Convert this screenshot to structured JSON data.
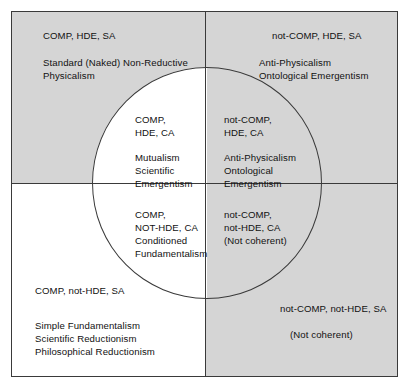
{
  "diagram": {
    "colors": {
      "shaded_fill": "#d5d5d5",
      "plain_fill": "#ffffff",
      "stroke": "#3a3a3a",
      "text": "#111111"
    },
    "outer_quadrants": {
      "top_left": {
        "heading": "COMP, HDE, SA",
        "body": "Standard (Naked) Non-Reductive\nPhysicalism"
      },
      "top_right": {
        "heading": "not-COMP, HDE, SA",
        "body": "Anti-Physicalism\nOntological Emergentism"
      },
      "bottom_left": {
        "heading": "COMP, not-HDE, SA",
        "body": "Simple Fundamentalism\nScientific Reductionism\nPhilosophical Reductionism"
      },
      "bottom_right": {
        "heading": "not-COMP, not-HDE, SA",
        "body": "(Not coherent)"
      }
    },
    "circle_quadrants": {
      "top_left": {
        "heading": "COMP,\nHDE, CA",
        "body": "Mutualism\nScientific\nEmergentism"
      },
      "top_right": {
        "heading": "not-COMP,\nHDE, CA",
        "body": "Anti-Physicalism\nOntological\nEmergentism"
      },
      "bottom_left": {
        "heading": "COMP,\nNOT-HDE, CA",
        "body": "Conditioned\nFundamentalism"
      },
      "bottom_right": {
        "heading": "not-COMP,\nnot-HDE, CA",
        "body": "(Not coherent)"
      }
    }
  }
}
